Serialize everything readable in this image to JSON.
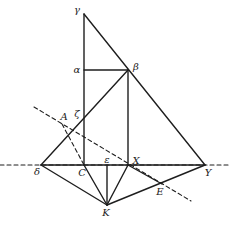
{
  "diagram": {
    "type": "geometric-construction",
    "points": {
      "gamma": {
        "label": "γ",
        "x": 84,
        "y": 14,
        "lx": 77,
        "ly": 10
      },
      "alpha": {
        "label": "α",
        "x": 84,
        "y": 70,
        "lx": 77,
        "ly": 70
      },
      "beta": {
        "label": "β",
        "x": 128,
        "y": 70,
        "lx": 136,
        "ly": 67
      },
      "zeta": {
        "label": "ζ",
        "x": 84,
        "y": 116,
        "lx": 77,
        "ly": 114
      },
      "A": {
        "label": "A",
        "x": 62,
        "y": 124,
        "lx": 64,
        "ly": 117
      },
      "delta": {
        "label": "δ",
        "x": 41,
        "y": 165,
        "lx": 37,
        "ly": 172
      },
      "C": {
        "label": "C",
        "x": 84,
        "y": 165,
        "lx": 82,
        "ly": 173
      },
      "epsilon": {
        "label": "ε",
        "x": 107,
        "y": 165,
        "lx": 107,
        "ly": 160
      },
      "X": {
        "label": "X",
        "x": 128,
        "y": 165,
        "lx": 136,
        "ly": 161
      },
      "Y": {
        "label": "Y",
        "x": 205,
        "y": 165,
        "lx": 208,
        "ly": 173
      },
      "E": {
        "label": "E",
        "x": 162,
        "y": 184,
        "lx": 160,
        "ly": 192
      },
      "K": {
        "label": "K",
        "x": 107,
        "y": 205,
        "lx": 106,
        "ly": 213
      }
    },
    "solid_segments": [
      [
        "gamma",
        "C"
      ],
      [
        "gamma",
        "Y"
      ],
      [
        "alpha",
        "beta"
      ],
      [
        "beta",
        "X"
      ],
      [
        "beta",
        "delta"
      ],
      [
        "delta",
        "Y"
      ],
      [
        "delta",
        "K"
      ],
      [
        "C",
        "K"
      ],
      [
        "epsilon",
        "K"
      ],
      [
        "X",
        "K"
      ],
      [
        "K",
        "Y"
      ],
      [
        "X",
        "E"
      ]
    ],
    "dashed_lines": [
      {
        "name": "horizontal-axis-line",
        "x1": 0,
        "y1": 165,
        "x2": 229,
        "y2": 165
      },
      {
        "name": "oblique-line-through-A-X-E",
        "x1": 34,
        "y1": 107,
        "x2": 191,
        "y2": 201
      },
      {
        "name": "segment-A-C",
        "x1": 62,
        "y1": 124,
        "x2": 84,
        "y2": 165
      }
    ]
  }
}
